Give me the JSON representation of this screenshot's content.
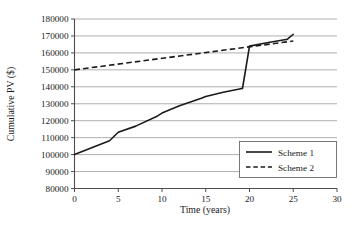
{
  "chart_data": {
    "type": "line",
    "title": "",
    "xlabel": "Time (years)",
    "ylabel": "Cumulative PV ($)",
    "xlim": [
      0,
      30
    ],
    "ylim": [
      80000,
      180000
    ],
    "xticks": [
      0,
      5,
      10,
      15,
      20,
      25,
      30
    ],
    "xtick_labels": [
      "0",
      "5",
      "10",
      "15",
      "20",
      "25",
      "30"
    ],
    "yticks": [
      80000,
      90000,
      100000,
      110000,
      120000,
      130000,
      140000,
      150000,
      160000,
      170000,
      180000
    ],
    "ytick_labels": [
      "80000",
      "90000",
      "100000",
      "110000",
      "120000",
      "130000",
      "140000",
      "150000",
      "160000",
      "170000",
      "180000"
    ],
    "grid": "horizontal",
    "legend_position": "lower-right",
    "series": [
      {
        "name": "Scheme 1",
        "style": "solid",
        "color": "#1a1a1a",
        "x": [
          0,
          4,
          5,
          7,
          9.5,
          10,
          12,
          14.5,
          15,
          17,
          19,
          19.2,
          20,
          22,
          24,
          24.3,
          25
        ],
        "values": [
          100000,
          108200,
          113200,
          116800,
          122800,
          124500,
          128800,
          133300,
          134300,
          136800,
          138900,
          139000,
          164000,
          166000,
          167800,
          168000,
          171000
        ]
      },
      {
        "name": "Scheme 2",
        "style": "dashed",
        "color": "#1a1a1a",
        "x": [
          0,
          25
        ],
        "values": [
          150000,
          167000
        ]
      }
    ]
  },
  "legend": {
    "entries": [
      {
        "label": "Scheme 1"
      },
      {
        "label": "Scheme 2"
      }
    ]
  },
  "axes": {
    "x_title": "Time (years)",
    "y_title": "Cumulative PV ($)"
  }
}
